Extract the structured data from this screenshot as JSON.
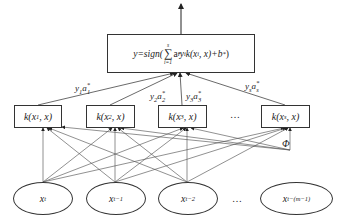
{
  "diagram": {
    "type": "SVM regression network (kernel layer)",
    "output": {
      "prefix": "y=sign(",
      "sum_upper": "s",
      "sum_lower": "i=1",
      "term": "a",
      "term_sup": "*",
      "term_sub": "i",
      "rest": "y",
      "rest_sub": "i",
      "kernel": "k(x",
      "kernel_sub": "i",
      "kernel_tail": ", x)+b",
      "b_sup": "*",
      "close": ")"
    },
    "weights": [
      {
        "y": "y",
        "y_sub": "1",
        "a": "a",
        "a_sub": "1",
        "a_sup": "*"
      },
      {
        "y": "y",
        "y_sub": "2",
        "a": "a",
        "a_sub": "2",
        "a_sup": "*"
      },
      {
        "y": "y",
        "y_sub": "3",
        "a": "a",
        "a_sub": "3",
        "a_sup": "*"
      },
      {
        "y": "y",
        "y_sub": "s",
        "a": "a",
        "a_sub": "s",
        "a_sup": "*"
      }
    ],
    "kernels": [
      {
        "pre": "k(x",
        "sub": "1",
        "post": ", x)"
      },
      {
        "pre": "k(x",
        "sub": "2",
        "post": ", x)"
      },
      {
        "pre": "k(x",
        "sub": "3",
        "post": ", x)"
      },
      {
        "pre": "k(x",
        "sub": "s",
        "post": ", x)"
      }
    ],
    "kernel_ellipsis": "…",
    "mapping_label": "Φ",
    "inputs": [
      {
        "base": "x",
        "sub": "t"
      },
      {
        "base": "x",
        "sub": "t−1"
      },
      {
        "base": "x",
        "sub": "t−2"
      },
      {
        "base": "x",
        "sub": "t−(m−1)"
      }
    ],
    "input_ellipsis": "…"
  }
}
